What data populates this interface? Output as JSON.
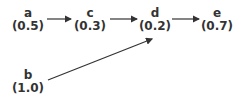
{
  "diagram": {
    "nodes": [
      {
        "id": "a",
        "label": "a",
        "value": "(0.5)"
      },
      {
        "id": "c",
        "label": "c",
        "value": "(0.3)"
      },
      {
        "id": "d",
        "label": "d",
        "value": "(0.2)"
      },
      {
        "id": "e",
        "label": "e",
        "value": "(0.7)"
      },
      {
        "id": "b",
        "label": "b",
        "value": "(1.0)"
      }
    ],
    "edges": [
      {
        "from": "a",
        "to": "c"
      },
      {
        "from": "c",
        "to": "d"
      },
      {
        "from": "d",
        "to": "e"
      },
      {
        "from": "b",
        "to": "d"
      }
    ],
    "colors": {
      "text": "#333333",
      "edge": "#333333"
    }
  }
}
